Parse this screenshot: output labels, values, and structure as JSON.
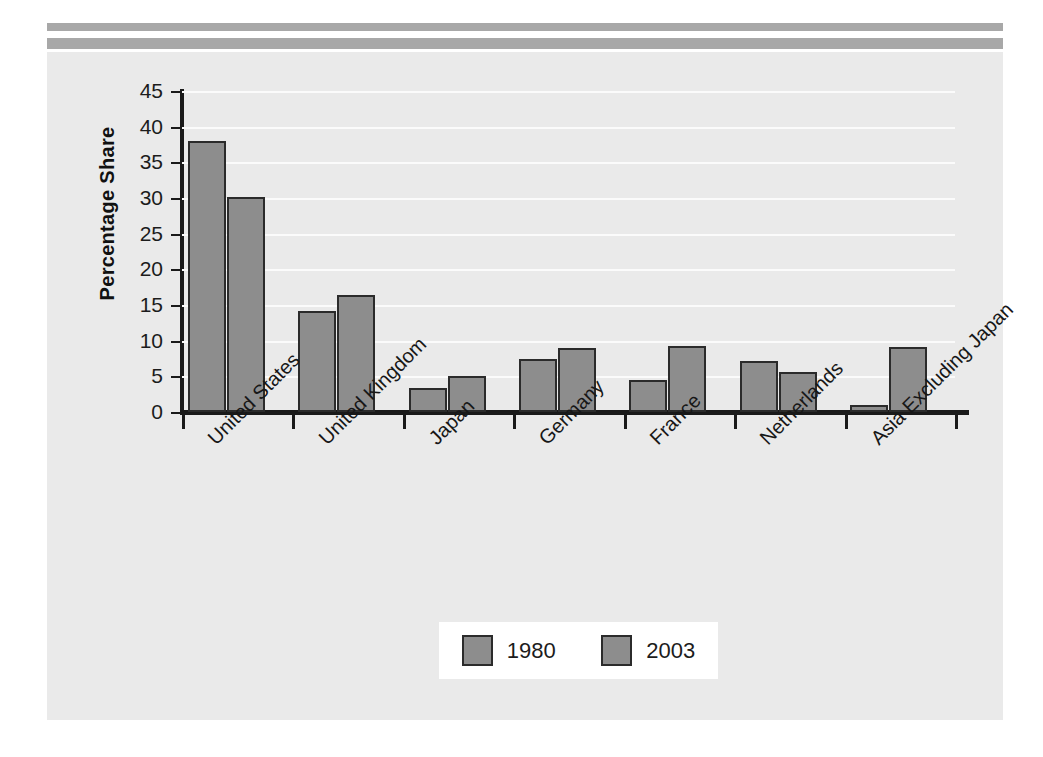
{
  "decor": {
    "rule_color": "#a8a8a8",
    "panel_color": "#eaeaea"
  },
  "chart_data": {
    "type": "bar",
    "title": "",
    "xlabel": "",
    "ylabel": "Percentage Share",
    "ylim": [
      0,
      45
    ],
    "yticks": [
      0,
      5,
      10,
      15,
      20,
      25,
      30,
      35,
      40,
      45
    ],
    "ytick_labels": [
      "0",
      "5",
      "10",
      "15",
      "20",
      "25",
      "30",
      "35",
      "40",
      "45"
    ],
    "grid": true,
    "grid_color": "#fbfbfb",
    "legend_position": "bottom-center",
    "bar_color": "#8d8d8d",
    "bar_border_color": "#2b2b2b",
    "categories": [
      "United States",
      "United Kingdom",
      "Japan",
      "Germany",
      "France",
      "Netherlands",
      "Asia Excluding Japan"
    ],
    "series": [
      {
        "name": "1980",
        "color": "#8d8d8d",
        "values": [
          38.0,
          14.2,
          3.4,
          7.5,
          4.5,
          7.2,
          1.0
        ]
      },
      {
        "name": "2003",
        "color": "#8d8d8d",
        "values": [
          30.2,
          16.4,
          5.0,
          9.0,
          9.3,
          5.6,
          9.1
        ]
      }
    ]
  },
  "legend": {
    "entries": [
      {
        "label": "1980",
        "swatch": "#8d8d8d"
      },
      {
        "label": "2003",
        "swatch": "#8d8d8d"
      }
    ]
  }
}
